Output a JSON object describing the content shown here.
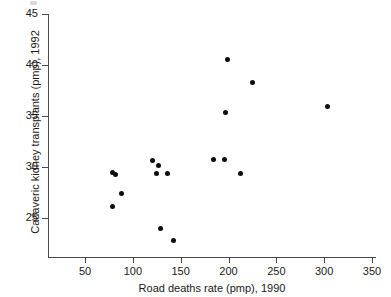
{
  "chart_data": {
    "type": "scatter",
    "title": "",
    "xlabel": "Road deaths rate (pmp), 1990",
    "ylabel": "Cadaveric kidney transplants (pmp), 1992",
    "xlim": [
      20,
      360
    ],
    "ylim": [
      21,
      45
    ],
    "grid": false,
    "legend": null,
    "xticks": [
      50,
      100,
      150,
      200,
      250,
      300,
      350
    ],
    "xtick_labels": [
      "50",
      "100",
      "150",
      "200",
      "250",
      "300",
      "350"
    ],
    "yticks": [
      25,
      30,
      35,
      40,
      45
    ],
    "ytick_labels": [
      "25",
      "30",
      "35",
      "40",
      "45"
    ],
    "marker": "filled-circle",
    "marker_color": "#0d0d0d",
    "points": [
      {
        "x": 79,
        "y": 26.1
      },
      {
        "x": 79,
        "y": 29.5
      },
      {
        "x": 82,
        "y": 29.3
      },
      {
        "x": 88,
        "y": 27.4
      },
      {
        "x": 121,
        "y": 30.6
      },
      {
        "x": 125,
        "y": 29.4
      },
      {
        "x": 127,
        "y": 30.1
      },
      {
        "x": 129,
        "y": 24.0
      },
      {
        "x": 136,
        "y": 29.4
      },
      {
        "x": 142,
        "y": 22.8
      },
      {
        "x": 184,
        "y": 30.7
      },
      {
        "x": 196,
        "y": 30.7
      },
      {
        "x": 197,
        "y": 35.3
      },
      {
        "x": 199,
        "y": 40.5
      },
      {
        "x": 213,
        "y": 29.4
      },
      {
        "x": 225,
        "y": 38.3
      },
      {
        "x": 303,
        "y": 35.9
      }
    ]
  }
}
